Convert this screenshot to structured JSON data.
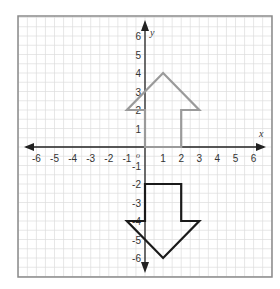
{
  "chart_data": {
    "type": "coordinate-plane",
    "title": "",
    "xlabel": "x",
    "ylabel": "y",
    "origin_label": "o",
    "xlim": [
      -7,
      7
    ],
    "ylim": [
      -7,
      7
    ],
    "grid": true,
    "x_ticks": [
      -6,
      -5,
      -4,
      -3,
      -2,
      -1,
      1,
      2,
      3,
      4,
      5,
      6
    ],
    "y_ticks": [
      6,
      5,
      4,
      3,
      2,
      1,
      -1,
      -2,
      -3,
      -4,
      -5,
      -6
    ],
    "shapes": [
      {
        "name": "up-arrow",
        "color": "#9a9a9a",
        "points": [
          [
            0,
            0
          ],
          [
            2,
            0
          ],
          [
            2,
            2
          ],
          [
            3,
            2
          ],
          [
            1,
            4
          ],
          [
            -1,
            2
          ],
          [
            0,
            2
          ]
        ]
      },
      {
        "name": "down-arrow",
        "color": "#1a1a1a",
        "points": [
          [
            0,
            -2
          ],
          [
            2,
            -2
          ],
          [
            2,
            -4
          ],
          [
            3,
            -4
          ],
          [
            1,
            -6
          ],
          [
            -1,
            -4
          ],
          [
            0,
            -4
          ]
        ]
      }
    ]
  },
  "colors": {
    "grid_line": "#dcdcdc",
    "frame": "#8a8a8a",
    "axis": "#222222"
  }
}
